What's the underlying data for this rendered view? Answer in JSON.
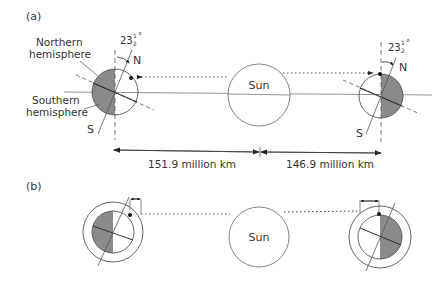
{
  "panel_a": {
    "label": "(a)",
    "northern_label_1": "Northern",
    "northern_label_2": "hemisphere",
    "southern_label_1": "Southern",
    "southern_label_2": "hemisphere",
    "tilt_left": "23",
    "tilt_right": "23",
    "tilt_frac_num": "1",
    "tilt_frac_den": "2",
    "degree": "°",
    "north_left": "N",
    "south_left": "S",
    "north_right": "N",
    "south_right": "S",
    "sun_label": "Sun",
    "distance_left": "151.9 million km",
    "distance_right": "146.9 million km"
  },
  "panel_b": {
    "label": "(b)",
    "sun_label": "Sun"
  },
  "colors": {
    "shade": "#8a8a8a",
    "line": "#555555"
  }
}
